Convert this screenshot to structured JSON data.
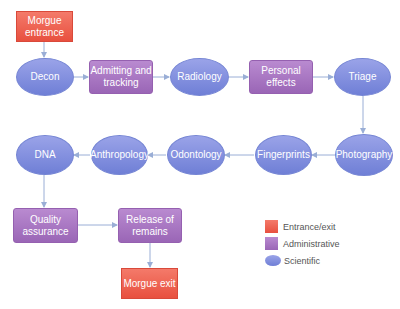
{
  "diagram": {
    "colors": {
      "entrance_exit": "#ec5c4a",
      "administrative": "#a878c2",
      "scientific": "#7d8bdc",
      "connector": "#9aaed6"
    },
    "nodes": {
      "morgue_entrance": {
        "label": "Morgue entrance",
        "type": "entrance_exit"
      },
      "decon": {
        "label": "Decon",
        "type": "scientific"
      },
      "admitting": {
        "label": "Admitting and tracking",
        "type": "administrative"
      },
      "radiology": {
        "label": "Radiology",
        "type": "scientific"
      },
      "personal_effects": {
        "label": "Personal effects",
        "type": "administrative"
      },
      "triage": {
        "label": "Triage",
        "type": "scientific"
      },
      "photography": {
        "label": "Photography",
        "type": "scientific"
      },
      "fingerprints": {
        "label": "Fingerprints",
        "type": "scientific"
      },
      "odontology": {
        "label": "Odontology",
        "type": "scientific"
      },
      "anthropology": {
        "label": "Anthropology",
        "type": "scientific"
      },
      "dna": {
        "label": "DNA",
        "type": "scientific"
      },
      "quality_assurance": {
        "label": "Quality assurance",
        "type": "administrative"
      },
      "release": {
        "label": "Release of remains",
        "type": "administrative"
      },
      "morgue_exit": {
        "label": "Morgue exit",
        "type": "entrance_exit"
      }
    },
    "edges": [
      [
        "morgue_entrance",
        "decon"
      ],
      [
        "decon",
        "admitting"
      ],
      [
        "admitting",
        "radiology"
      ],
      [
        "radiology",
        "personal_effects"
      ],
      [
        "personal_effects",
        "triage"
      ],
      [
        "triage",
        "photography"
      ],
      [
        "photography",
        "fingerprints"
      ],
      [
        "fingerprints",
        "odontology"
      ],
      [
        "odontology",
        "anthropology"
      ],
      [
        "anthropology",
        "dna"
      ],
      [
        "dna",
        "quality_assurance"
      ],
      [
        "quality_assurance",
        "release"
      ],
      [
        "release",
        "morgue_exit"
      ]
    ],
    "legend": [
      {
        "label": "Entrance/exit",
        "shape": "square"
      },
      {
        "label": "Administrative",
        "shape": "square"
      },
      {
        "label": "Scientific",
        "shape": "ellipse"
      }
    ]
  }
}
